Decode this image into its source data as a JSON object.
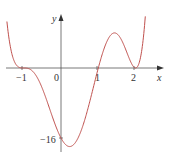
{
  "chart_data": {
    "type": "line",
    "title": "",
    "xlabel": "x",
    "ylabel": "y",
    "x_ticks": [
      {
        "value": -1,
        "label": "−1"
      },
      {
        "value": 0,
        "label": "0"
      },
      {
        "value": 1,
        "label": "1"
      },
      {
        "value": 2,
        "label": "2"
      }
    ],
    "y_ticks": [
      {
        "value": -16,
        "label": "−16"
      }
    ],
    "xlim": [
      -1.4,
      2.5
    ],
    "ylim": [
      -18,
      12
    ],
    "grid": false,
    "legend": null,
    "series": [
      {
        "name": "f(x)",
        "color": "#c0504d",
        "key_points": [
          {
            "x": -1,
            "y": 0
          },
          {
            "x": 0,
            "y": -16
          },
          {
            "x": 1,
            "y": 0
          },
          {
            "x": 2,
            "y": 0
          }
        ],
        "x": [
          -1.35,
          -1.25,
          -1.15,
          -1.0,
          -0.8,
          -0.6,
          -0.4,
          -0.2,
          0.0,
          0.2,
          0.4,
          0.6,
          0.8,
          1.0,
          1.2,
          1.4,
          1.6,
          1.8,
          2.0,
          2.2,
          2.4
        ],
        "y": [
          10,
          2.2,
          0.4,
          0,
          -0.6,
          -3.6,
          -8.8,
          -14.1,
          -16,
          -14.9,
          -11.4,
          -6.6,
          -2.2,
          0,
          1.0,
          1.3,
          0.8,
          0.2,
          0,
          0.5,
          6
        ]
      }
    ],
    "annotations": []
  },
  "axes": {
    "x_label": "x",
    "y_label": "y",
    "origin_label": "0",
    "tick_labels_x": [
      "−1",
      "1",
      "2"
    ],
    "tick_label_y": "−16"
  }
}
